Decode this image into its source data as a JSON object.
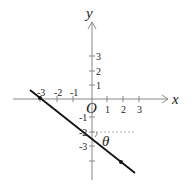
{
  "diagram": {
    "axes": {
      "x_label": "x",
      "y_label": "y",
      "origin_label": "O",
      "x_ticks": [
        "-3",
        "-2",
        "-1",
        "1",
        "2",
        "3"
      ],
      "y_ticks": [
        "3",
        "2",
        "1",
        "-1",
        "-2",
        "-3"
      ]
    },
    "angle_label": "θ",
    "line": {
      "description": "line through (-3,0) and (0,-2)",
      "x_intercept": "-3",
      "y_intercept": "-2"
    }
  }
}
